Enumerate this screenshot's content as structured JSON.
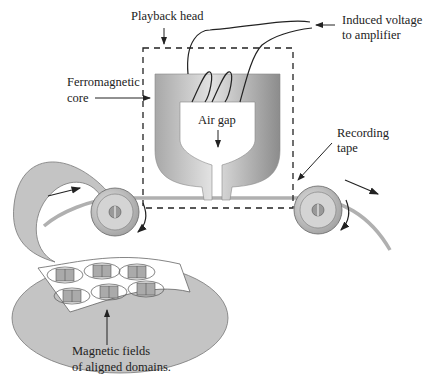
{
  "diagram": {
    "labels": {
      "playback_head": "Playback head",
      "induced_line1": "Induced voltage",
      "induced_line2": "to amplifier",
      "ferro_line1": "Ferromagnetic",
      "ferro_line2": "core",
      "air_gap": "Air gap",
      "tape_line1": "Recording",
      "tape_line2": "tape",
      "fields_line1": "Magnetic fields",
      "fields_line2": "of aligned domains."
    },
    "colors": {
      "core_light": "#d9d9d9",
      "core_dark": "#8f8f8f",
      "tape": "#b8b8b8",
      "tape_edge": "#8a8a8a",
      "roller_outer": "#a9a9a9",
      "roller_inner": "#d6d6d6",
      "ink": "#222222"
    },
    "domains_count": 6
  }
}
